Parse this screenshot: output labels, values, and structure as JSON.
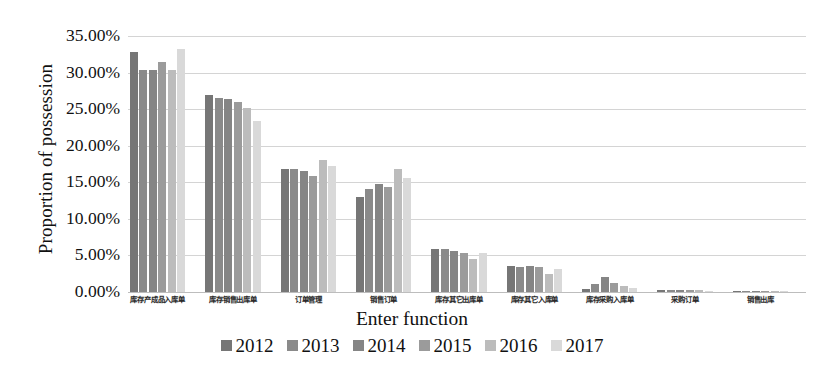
{
  "chart_data": {
    "type": "bar",
    "title": "",
    "xlabel": "Enter function",
    "ylabel": "Proportion of possession",
    "ylim": [
      0,
      35
    ],
    "grid": true,
    "legend_position": "bottom",
    "y_ticks": [
      "0.00%",
      "5.00%",
      "10.00%",
      "15.00%",
      "20.00%",
      "25.00%",
      "30.00%",
      "35.00%"
    ],
    "y_tick_values": [
      0,
      5,
      10,
      15,
      20,
      25,
      30,
      35
    ],
    "categories": [
      "库存产成品入库单",
      "库存销售出库单",
      "订单管理",
      "销售订单",
      "库存其它出库单",
      "库存其它入库单",
      "库存采购入库单",
      "采购订单",
      "销售出库"
    ],
    "series": [
      {
        "name": "2012",
        "color": "#767676",
        "values": [
          32.8,
          27.0,
          16.8,
          13.0,
          5.9,
          3.5,
          0.4,
          0.3,
          0.05
        ]
      },
      {
        "name": "2013",
        "color": "#8a8a8a",
        "values": [
          30.3,
          26.5,
          16.8,
          14.1,
          5.9,
          3.4,
          1.1,
          0.3,
          0.05
        ]
      },
      {
        "name": "2014",
        "color": "#858585",
        "values": [
          30.4,
          26.4,
          16.5,
          14.8,
          5.6,
          3.6,
          2.0,
          0.3,
          0.05
        ]
      },
      {
        "name": "2015",
        "color": "#9b9b9b",
        "values": [
          31.4,
          26.0,
          15.8,
          14.3,
          5.4,
          3.4,
          1.2,
          0.3,
          0.05
        ]
      },
      {
        "name": "2016",
        "color": "#bcbcbc",
        "values": [
          30.3,
          25.2,
          18.0,
          16.8,
          4.5,
          2.5,
          0.8,
          0.25,
          0.05
        ]
      },
      {
        "name": "2017",
        "color": "#d9d9d9",
        "values": [
          33.2,
          23.4,
          17.2,
          15.6,
          5.3,
          3.1,
          0.5,
          0.2,
          0.05
        ]
      }
    ]
  }
}
